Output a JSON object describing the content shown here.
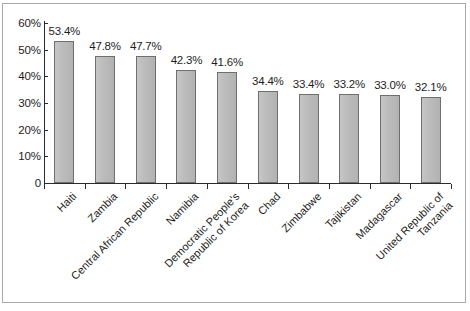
{
  "figure": {
    "frame_color": "#a9a9a9",
    "background": "#ffffff"
  },
  "chart_data": {
    "type": "bar",
    "title": "",
    "subtitle": "",
    "xlabel": "",
    "ylabel": "",
    "ylim": [
      0,
      60
    ],
    "yticks": [
      "0",
      "10%",
      "20%",
      "30%",
      "40%",
      "50%",
      "60%"
    ],
    "ytick_values": [
      0,
      10,
      20,
      30,
      40,
      50,
      60
    ],
    "grid": false,
    "legend": null,
    "bar_color": "#b9b9b9",
    "bar_border_color": "#6f6f6f",
    "categories": [
      "Haiti",
      "Zambia",
      "Central African Republic",
      "Democratic People's Republic of Korea",
      "Namibia",
      "Chad",
      "Zimbabwe",
      "Tajikistan",
      "Madagascar",
      "United Republic of Tanzania"
    ],
    "category_lines": [
      [
        "Haiti"
      ],
      [
        "Zambia"
      ],
      [
        "Central African Republic"
      ],
      [
        "Namibia"
      ],
      [
        "Democratic People's",
        "Republic of Korea"
      ],
      [
        "Chad"
      ],
      [
        "Zimbabwe"
      ],
      [
        "Tajikistan"
      ],
      [
        "Madagascar"
      ],
      [
        "United Republic of",
        "Tanzania"
      ]
    ],
    "values": [
      53.4,
      47.8,
      47.7,
      42.3,
      41.6,
      34.4,
      33.4,
      33.2,
      33.0,
      32.1
    ],
    "value_labels": [
      "53.4%",
      "47.8%",
      "47.7%",
      "42.3%",
      "41.6%",
      "34.4%",
      "33.4%",
      "33.2%",
      "33.0%",
      "32.1%"
    ],
    "ordered_categories": [
      "Haiti",
      "Zambia",
      "Central African Republic",
      "Namibia",
      "Democratic People's Republic of Korea",
      "Chad",
      "Zimbabwe",
      "Tajikistan",
      "Madagascar",
      "United Republic of Tanzania"
    ]
  }
}
